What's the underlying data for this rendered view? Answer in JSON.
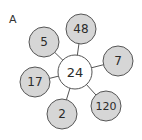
{
  "panel_label": "A",
  "center": {
    "value": "24",
    "cx": 75,
    "cy": 72,
    "r": 17,
    "fill": "#ffffff"
  },
  "satellites": [
    {
      "value": "48",
      "cx": 81,
      "cy": 29,
      "r": 15
    },
    {
      "value": "5",
      "cx": 44,
      "cy": 42,
      "r": 15
    },
    {
      "value": "7",
      "cx": 118,
      "cy": 61,
      "r": 15
    },
    {
      "value": "17",
      "cx": 35,
      "cy": 82,
      "r": 15
    },
    {
      "value": "120",
      "cx": 106,
      "cy": 106,
      "r": 15
    },
    {
      "value": "2",
      "cx": 62,
      "cy": 114,
      "r": 15
    }
  ],
  "colors": {
    "satellite_fill": "#d6d6d6",
    "stroke": "#555555",
    "center_fill": "#ffffff"
  }
}
